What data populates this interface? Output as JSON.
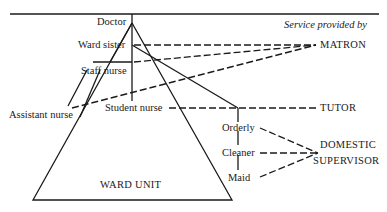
{
  "header": {
    "service_caption": "Service provided by"
  },
  "ward": {
    "title": "WARD UNIT",
    "staff": {
      "doctor": "Doctor",
      "ward_sister": "Ward sister",
      "staff_nurse": "Staff nurse",
      "assistant_nurse": "Assistant nurse",
      "student_nurse": "Student nurse",
      "orderly": "Orderly",
      "cleaner": "Cleaner",
      "maid": "Maid"
    }
  },
  "services": {
    "matron": "MATRON",
    "tutor": "TUTOR",
    "domestic_line1": "DOMESTIC",
    "domestic_line2": "SUPERVISOR"
  },
  "links": [
    {
      "from": "Ward sister",
      "to": "MATRON",
      "style": "dashed"
    },
    {
      "from": "Staff nurse",
      "to": "MATRON",
      "style": "dashed"
    },
    {
      "from": "Assistant nurse",
      "to": "MATRON",
      "style": "dashed"
    },
    {
      "from": "Student nurse",
      "to": "TUTOR",
      "style": "dashed"
    },
    {
      "from": "Orderly",
      "to": "DOMESTIC SUPERVISOR",
      "style": "dashed"
    },
    {
      "from": "Cleaner",
      "to": "DOMESTIC SUPERVISOR",
      "style": "dashed"
    },
    {
      "from": "Maid",
      "to": "DOMESTIC SUPERVISOR",
      "style": "dashed"
    }
  ]
}
